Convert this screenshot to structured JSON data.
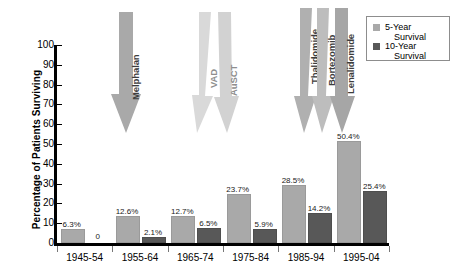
{
  "chart_data": {
    "type": "bar",
    "title": "",
    "subtitle": "",
    "xlabel": "",
    "ylabel": "Percentage of Patients Surviving",
    "ylim": [
      0,
      100
    ],
    "ytick_values": [
      0,
      10,
      20,
      30,
      40,
      50,
      60,
      70,
      80,
      90,
      100
    ],
    "ytick_labels": [
      "0",
      "10",
      "20",
      "30",
      "40",
      "50",
      "60",
      "70",
      "80",
      "90",
      "100"
    ],
    "grid": false,
    "legend_position": "top-right",
    "categories": [
      "1945-54",
      "1955-64",
      "1965-74",
      "1975-84",
      "1985-94",
      "1995-04"
    ],
    "series": [
      {
        "name": "5-Year Survival",
        "color": "#a9a9a9",
        "values": [
          6.3,
          12.6,
          12.7,
          23.7,
          28.5,
          50.4
        ],
        "labels": [
          "6.3%",
          "12.6%",
          "12.7%",
          "23.7%",
          "28.5%",
          "50.4%"
        ]
      },
      {
        "name": "10-Year Survival",
        "color": "#585858",
        "values": [
          0,
          2.1,
          6.5,
          5.9,
          14.2,
          25.4
        ],
        "labels": [
          "0",
          "2.1%",
          "6.5%",
          "5.9%",
          "14.2%",
          "25.4%"
        ]
      }
    ],
    "annotations": [
      {
        "label": "Melphalan",
        "group": "melphalan",
        "color": "#a9a9a9"
      },
      {
        "label": "VAD",
        "group": "vad-ausct",
        "color": "#d9d9d9"
      },
      {
        "label": "AuSCT",
        "group": "vad-ausct",
        "color": "#d2d2d2"
      },
      {
        "label": "Thalidomide",
        "group": "novel-agents",
        "color": "#b0b0b0"
      },
      {
        "label": "Bortezomib",
        "group": "novel-agents",
        "color": "#bdbdbd"
      },
      {
        "label": "Lenalidomide",
        "group": "novel-agents",
        "color": "#a6a6a6"
      }
    ]
  },
  "legend": {
    "items": [
      {
        "line1": "5-Year",
        "line2": "Survival"
      },
      {
        "line1": "10-Year",
        "line2": "Survival"
      }
    ]
  }
}
